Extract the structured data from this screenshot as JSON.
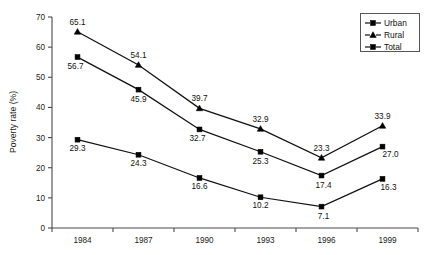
{
  "chart_data": {
    "type": "line",
    "title": "",
    "subtitle": "",
    "xlabel": "",
    "ylabel": "Poverty rate (%)",
    "categories": [
      "1984",
      "1987",
      "1990",
      "1993",
      "1996",
      "1999"
    ],
    "x": [
      1984,
      1987,
      1990,
      1993,
      1996,
      1999
    ],
    "ylim": [
      0,
      70
    ],
    "yticks": [
      0,
      10,
      20,
      30,
      40,
      50,
      60,
      70
    ],
    "ytick_labels": [
      "0",
      "10",
      "20",
      "30",
      "40",
      "50",
      "60",
      "70"
    ],
    "grid": false,
    "legend_position": "top-right",
    "series": [
      {
        "name": "Urban",
        "marker": "square",
        "values": [
          29.3,
          24.3,
          16.6,
          10.2,
          7.1,
          16.3
        ],
        "labels": [
          "29.3",
          "24.3",
          "16.6",
          "10.2",
          "7.1",
          "16.3"
        ]
      },
      {
        "name": "Rural",
        "marker": "triangle",
        "values": [
          65.1,
          54.1,
          39.7,
          32.9,
          23.3,
          33.9
        ],
        "labels": [
          "65.1",
          "54.1",
          "39.7",
          "32.9",
          "23.3",
          "33.9"
        ]
      },
      {
        "name": "Total",
        "marker": "square",
        "values": [
          56.7,
          45.9,
          32.7,
          25.3,
          17.4,
          27.0
        ],
        "labels": [
          "56.7",
          "45.9",
          "32.7",
          "25.3",
          "17.4",
          "27.0"
        ]
      }
    ],
    "colors": {
      "line": "#111111",
      "marker": "#000000",
      "axis": "#4a4a4a",
      "background": "#ffffff"
    }
  },
  "legend": {
    "items": [
      {
        "label": "Urban",
        "marker": "square"
      },
      {
        "label": "Rural",
        "marker": "triangle"
      },
      {
        "label": "Total",
        "marker": "square"
      }
    ]
  },
  "axes": {
    "y_title": "Poverty rate (%)",
    "y_tick_labels": [
      "0",
      "10",
      "20",
      "30",
      "40",
      "50",
      "60",
      "70"
    ],
    "x_tick_labels": [
      "1984",
      "1987",
      "1990",
      "1993",
      "1996",
      "1999"
    ]
  },
  "point_labels": {
    "urban": [
      "29.3",
      "24.3",
      "16.6",
      "10.2",
      "7.1",
      "16.3"
    ],
    "rural": [
      "65.1",
      "54.1",
      "39.7",
      "32.9",
      "23.3",
      "33.9"
    ],
    "total": [
      "56.7",
      "45.9",
      "32.7",
      "25.3",
      "17.4",
      "27.0"
    ]
  }
}
